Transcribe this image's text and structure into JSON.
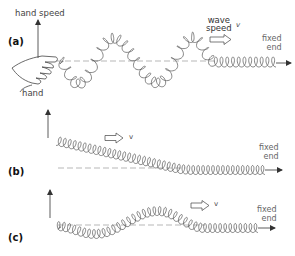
{
  "figure": {
    "colors": {
      "coil": "#555555",
      "axis": "#888888",
      "text": "#333333",
      "background": "#ffffff"
    },
    "panels": [
      {
        "id": "a",
        "label": "(a)",
        "vertical_arrow_label": "hand speed",
        "hand_label": "hand",
        "wave_speed_label_line1": "wave",
        "wave_speed_label_line2": "speed",
        "speed_symbol": "v",
        "fixed_end_line1": "fixed",
        "fixed_end_line2": "end"
      },
      {
        "id": "b",
        "label": "(b)",
        "speed_symbol": "v",
        "fixed_end_line1": "fixed",
        "fixed_end_line2": "end"
      },
      {
        "id": "c",
        "label": "(c)",
        "speed_symbol": "v",
        "fixed_end_line1": "fixed",
        "fixed_end_line2": "end"
      }
    ]
  }
}
